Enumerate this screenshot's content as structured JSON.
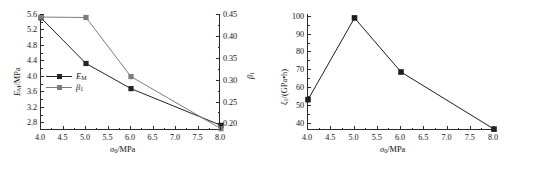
{
  "figure": {
    "panel_count": 2,
    "background_color": "#ffffff",
    "axis_color": "#2b2b2b"
  },
  "left_panel": {
    "x_axis_title_html": "<i>&#963;</i><sub>0</sub>/MPa",
    "y_left_axis_title_html": "<i>E</i><sub>M</sub>/MPa",
    "y_right_axis_title_html": "<i>&#946;</i><sub>1</sub>",
    "x_ticks": [
      "4.0",
      "4.5",
      "5.0",
      "5.5",
      "6.0",
      "6.5",
      "7.0",
      "7.5",
      "8.0"
    ],
    "y_left_ticks": [
      "2.8",
      "3.2",
      "3.6",
      "4.0",
      "4.4",
      "4.8",
      "5.2",
      "5.6"
    ],
    "y_right_ticks": [
      "0.20",
      "0.25",
      "0.30",
      "0.35",
      "0.40",
      "0.45"
    ],
    "legend": [
      {
        "label_html": "<i>E</i><sub>M</sub>",
        "color": "#232323",
        "marker": "filled-square"
      },
      {
        "label_html": "<i>&#946;</i><sub>1</sub>",
        "color": "#7c7c7c",
        "marker": "filled-square"
      }
    ]
  },
  "right_panel": {
    "x_axis_title_html": "<i>&#963;</i><sub>0</sub>/MPa",
    "y_axis_title_html": "<i>&#958;</i><sub>1</sub>/(GPa&#8226;h)",
    "x_ticks": [
      "4.0",
      "4.5",
      "5.0",
      "5.5",
      "6.0",
      "6.5",
      "7.0",
      "7.5",
      "8.0"
    ],
    "y_ticks": [
      "40",
      "50",
      "60",
      "70",
      "80",
      "90",
      "100"
    ]
  },
  "chart_data": [
    {
      "type": "line",
      "title": "",
      "xlabel": "sigma_0/MPa",
      "ylabel": "E_M/MPa",
      "y2label": "beta_1",
      "xlim": [
        4.0,
        8.0
      ],
      "ylim": [
        2.6,
        5.6
      ],
      "y2lim": [
        0.185,
        0.45
      ],
      "grid": false,
      "legend_position": "inside-left-middle",
      "x": [
        4.0,
        5.0,
        6.0,
        8.0
      ],
      "series": [
        {
          "name": "E_M",
          "axis": "left",
          "units": "MPa",
          "color": "#232323",
          "marker": "filled-square",
          "values": [
            5.5,
            4.32,
            3.67,
            2.72
          ]
        },
        {
          "name": "beta_1",
          "axis": "right",
          "units": "",
          "color": "#7c7c7c",
          "marker": "filled-square",
          "values": [
            0.443,
            0.442,
            0.307,
            0.188
          ]
        }
      ]
    },
    {
      "type": "line",
      "title": "",
      "xlabel": "sigma_0/MPa",
      "ylabel": "xi_1/(GPa*h)",
      "xlim": [
        4.0,
        8.0
      ],
      "ylim": [
        36.0,
        101.0
      ],
      "grid": false,
      "legend_position": "none",
      "x": [
        4.0,
        5.0,
        6.0,
        8.0
      ],
      "series": [
        {
          "name": "xi_1",
          "axis": "left",
          "units": "GPa*h",
          "color": "#1e1e1e",
          "marker": "filled-square",
          "values": [
            53.0,
            98.8,
            68.5,
            36.5
          ]
        }
      ]
    }
  ]
}
